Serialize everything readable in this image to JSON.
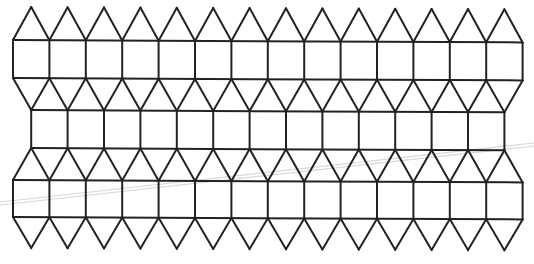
{
  "figure": {
    "bands": [
      {
        "name": "top-band",
        "squares": 14,
        "offset": "none"
      },
      {
        "name": "middle-band",
        "squares": 13,
        "offset": "half"
      },
      {
        "name": "bottom-band",
        "squares": 14,
        "offset": "none"
      }
    ],
    "top_cap_triangles": 14,
    "bottom_cap_triangles": 14,
    "line_color": "#222222",
    "background_color": "#ffffff",
    "scan_artifact_color": "#d8d8d8"
  }
}
